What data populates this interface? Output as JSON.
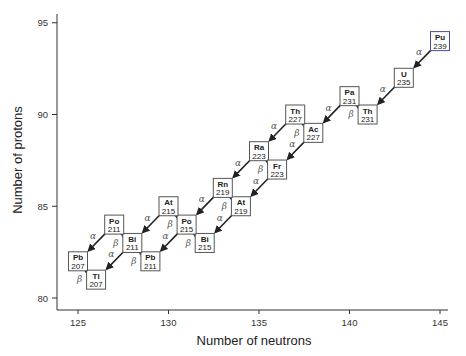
{
  "chart_data": {
    "type": "scatter",
    "title": "",
    "xlabel": "Number of neutrons",
    "ylabel": "Number of protons",
    "xlim": [
      124,
      146
    ],
    "ylim": [
      79,
      95.5
    ],
    "xticks": [
      125,
      130,
      135,
      140,
      145
    ],
    "yticks": [
      80,
      85,
      90,
      95
    ],
    "grid": false,
    "nuclides": [
      {
        "symbol": "Pu",
        "mass": 239,
        "Z": 94,
        "N": 145,
        "highlight": true
      },
      {
        "symbol": "U",
        "mass": 235,
        "Z": 92,
        "N": 143
      },
      {
        "symbol": "Th",
        "mass": 231,
        "Z": 90,
        "N": 141
      },
      {
        "symbol": "Pa",
        "mass": 231,
        "Z": 91,
        "N": 140
      },
      {
        "symbol": "Ac",
        "mass": 227,
        "Z": 89,
        "N": 138
      },
      {
        "symbol": "Th",
        "mass": 227,
        "Z": 90,
        "N": 137
      },
      {
        "symbol": "Ra",
        "mass": 223,
        "Z": 88,
        "N": 135
      },
      {
        "symbol": "Fr",
        "mass": 223,
        "Z": 87,
        "N": 136
      },
      {
        "symbol": "At",
        "mass": 219,
        "Z": 85,
        "N": 134
      },
      {
        "symbol": "Rn",
        "mass": 219,
        "Z": 86,
        "N": 133
      },
      {
        "symbol": "Bi",
        "mass": 215,
        "Z": 83,
        "N": 132
      },
      {
        "symbol": "Po",
        "mass": 215,
        "Z": 84,
        "N": 131
      },
      {
        "symbol": "At",
        "mass": 215,
        "Z": 85,
        "N": 130
      },
      {
        "symbol": "Pb",
        "mass": 211,
        "Z": 82,
        "N": 129
      },
      {
        "symbol": "Bi",
        "mass": 211,
        "Z": 83,
        "N": 128
      },
      {
        "symbol": "Po",
        "mass": 211,
        "Z": 84,
        "N": 127
      },
      {
        "symbol": "Tl",
        "mass": 207,
        "Z": 81,
        "N": 126
      },
      {
        "symbol": "Pb",
        "mass": 207,
        "Z": 82,
        "N": 125
      }
    ],
    "decays": [
      {
        "type": "α",
        "from": "Pu239",
        "fromNZ": [
          145,
          94
        ],
        "toNZ": [
          143,
          92
        ]
      },
      {
        "type": "α",
        "from": "U235",
        "fromNZ": [
          143,
          92
        ],
        "toNZ": [
          141,
          90
        ]
      },
      {
        "type": "β",
        "from": "Th231",
        "fromNZ": [
          141,
          90
        ],
        "toNZ": [
          140,
          91
        ]
      },
      {
        "type": "α",
        "from": "Pa231",
        "fromNZ": [
          140,
          91
        ],
        "toNZ": [
          138,
          89
        ]
      },
      {
        "type": "β",
        "from": "Ac227",
        "fromNZ": [
          138,
          89
        ],
        "toNZ": [
          137,
          90
        ]
      },
      {
        "type": "α",
        "from": "Ac227",
        "fromNZ": [
          138,
          89
        ],
        "toNZ": [
          136,
          87
        ]
      },
      {
        "type": "α",
        "from": "Th227",
        "fromNZ": [
          137,
          90
        ],
        "toNZ": [
          135,
          88
        ]
      },
      {
        "type": "β",
        "from": "Fr223",
        "fromNZ": [
          136,
          87
        ],
        "toNZ": [
          135,
          88
        ]
      },
      {
        "type": "α",
        "from": "Fr223",
        "fromNZ": [
          136,
          87
        ],
        "toNZ": [
          134,
          85
        ]
      },
      {
        "type": "α",
        "from": "Ra223",
        "fromNZ": [
          135,
          88
        ],
        "toNZ": [
          133,
          86
        ]
      },
      {
        "type": "β",
        "from": "At219",
        "fromNZ": [
          134,
          85
        ],
        "toNZ": [
          133,
          86
        ]
      },
      {
        "type": "α",
        "from": "At219",
        "fromNZ": [
          134,
          85
        ],
        "toNZ": [
          132,
          83
        ]
      },
      {
        "type": "α",
        "from": "Rn219",
        "fromNZ": [
          133,
          86
        ],
        "toNZ": [
          131,
          84
        ]
      },
      {
        "type": "β",
        "from": "Bi215",
        "fromNZ": [
          132,
          83
        ],
        "toNZ": [
          131,
          84
        ]
      },
      {
        "type": "β",
        "from": "Po215",
        "fromNZ": [
          131,
          84
        ],
        "toNZ": [
          130,
          85
        ]
      },
      {
        "type": "α",
        "from": "Po215",
        "fromNZ": [
          131,
          84
        ],
        "toNZ": [
          129,
          82
        ]
      },
      {
        "type": "α",
        "from": "At215",
        "fromNZ": [
          130,
          85
        ],
        "toNZ": [
          128,
          83
        ]
      },
      {
        "type": "β",
        "from": "Pb211",
        "fromNZ": [
          129,
          82
        ],
        "toNZ": [
          128,
          83
        ]
      },
      {
        "type": "β",
        "from": "Bi211",
        "fromNZ": [
          128,
          83
        ],
        "toNZ": [
          127,
          84
        ]
      },
      {
        "type": "α",
        "from": "Bi211",
        "fromNZ": [
          128,
          83
        ],
        "toNZ": [
          126,
          81
        ]
      },
      {
        "type": "α",
        "from": "Po211",
        "fromNZ": [
          127,
          84
        ],
        "toNZ": [
          125,
          82
        ]
      },
      {
        "type": "β",
        "from": "Tl207",
        "fromNZ": [
          126,
          81
        ],
        "toNZ": [
          125,
          82
        ]
      }
    ]
  },
  "axes": {
    "x_title": "Number of neutrons",
    "y_title": "Number of protons",
    "x_ticks": [
      "125",
      "130",
      "135",
      "140",
      "145"
    ],
    "y_ticks": [
      "80",
      "85",
      "90",
      "95"
    ]
  },
  "caption": "Figure 2.1  The decay series of plutonium-239",
  "colors": {
    "box_border": "#555555",
    "highlight_border": "#4a4aa8",
    "arrow": "#222222",
    "axis": "#333333"
  }
}
